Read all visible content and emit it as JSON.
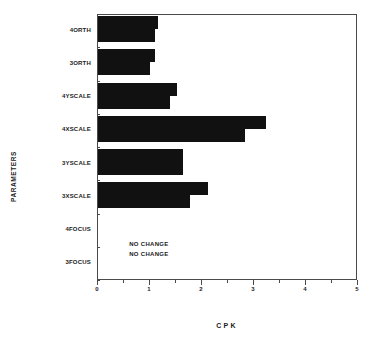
{
  "chart_data": {
    "type": "bar",
    "orientation": "horizontal",
    "title": "",
    "xlabel": "CPK",
    "ylabel": "PARAMETERS",
    "xlim": [
      0,
      5
    ],
    "ylim": null,
    "grid": false,
    "legend": null,
    "xticks": [
      0,
      1,
      2,
      3,
      4,
      5
    ],
    "xticklabels": [
      "0",
      "1",
      "2",
      "3",
      "4",
      "5"
    ],
    "xminor_ticks": [
      0.5,
      1.5,
      2.5,
      3.5,
      4.5
    ],
    "categories": [
      "4ORTH",
      "3ORTH",
      "4YSCALE",
      "4XSCALE",
      "3YSCALE",
      "3XSCALE",
      "4FOCUS",
      "3FOCUS"
    ],
    "series": [
      {
        "name": "Series A",
        "values": [
          1.17,
          1.12,
          1.54,
          3.25,
          1.65,
          2.13,
          0,
          0
        ]
      },
      {
        "name": "Series B",
        "values": [
          1.12,
          1.02,
          1.4,
          2.85,
          1.65,
          1.79,
          0,
          0
        ]
      }
    ],
    "annotations": [
      {
        "text": "NO CHANGE",
        "x": 0.62,
        "category": "4FOCUS"
      },
      {
        "text": "NO CHANGE",
        "x": 0.62,
        "category": "3FOCUS"
      }
    ],
    "bar_color": "#111111",
    "axis_color": "#4a4a4a"
  }
}
